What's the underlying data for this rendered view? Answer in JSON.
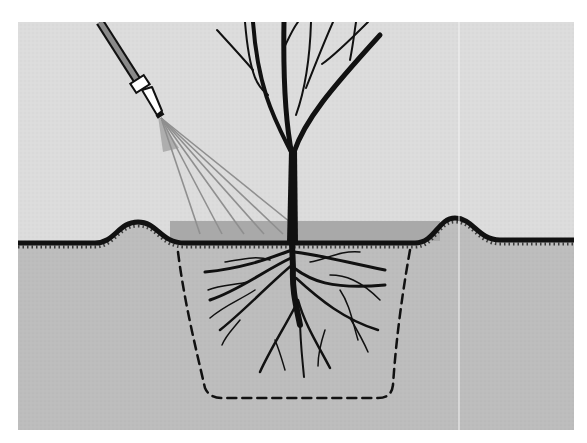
{
  "figure": {
    "frame": {
      "x": 18,
      "y": 22,
      "width": 556,
      "height": 408
    },
    "colors": {
      "page": "#ffffff",
      "sky": "#dcdcdc",
      "soil": "#bdbdbd",
      "water": "#a9a9a9",
      "ink": "#111111",
      "hose": "#8a8a8a",
      "spray": "#8f8f8f",
      "nozzle": "#ffffff",
      "crease": "#f2f2f2"
    },
    "ground": {
      "path": "M18,243 L95,243 C115,243 118,222 138,222 C158,222 160,243 185,243 L415,243 C435,243 438,218 455,218 C473,218 478,240 500,240 L574,240"
    },
    "water_basin": {
      "x": 170,
      "y": 221,
      "width": 270,
      "height": 20
    },
    "hose": {
      "tube": {
        "x1": 100,
        "y1": 22,
        "x2": 137,
        "y2": 80
      },
      "coupling": {
        "cx": 140,
        "cy": 84,
        "w": 16,
        "h": 11,
        "angle": 57
      },
      "nozzle": "M142,90 L152,87 L162,111 L157,115 Z",
      "tip": {
        "cx": 160,
        "cy": 115,
        "w": 8,
        "h": 4,
        "angle": 57
      }
    },
    "spray": {
      "origin": {
        "x": 161,
        "y": 118
      },
      "targets": [
        {
          "x": 200,
          "y": 234
        },
        {
          "x": 222,
          "y": 234
        },
        {
          "x": 244,
          "y": 234
        },
        {
          "x": 264,
          "y": 234
        },
        {
          "x": 283,
          "y": 234
        },
        {
          "x": 290,
          "y": 222
        }
      ]
    },
    "trunk": "M289,150 L297,150 L298,243 L287,243 Z",
    "branches": [
      {
        "d": "M292,155 C285,120 283,80 284,22",
        "w": 5
      },
      {
        "d": "M294,152 C305,120 330,90 380,35",
        "w": 5
      },
      {
        "d": "M290,150 C275,120 258,90 253,22",
        "w": 4
      },
      {
        "d": "M253,70 C240,55 228,42 217,30",
        "w": 2
      },
      {
        "d": "M268,95 C260,88 250,82 245,22",
        "w": 2
      },
      {
        "d": "M283,50 C288,40 292,30 298,22",
        "w": 2
      },
      {
        "d": "M296,115 C305,90 310,55 311,22",
        "w": 2
      },
      {
        "d": "M306,88 C315,65 325,40 333,22",
        "w": 2
      },
      {
        "d": "M322,64 C335,55 350,40 368,22",
        "w": 2
      },
      {
        "d": "M350,60 C353,45 354,35 356,22",
        "w": 2
      }
    ],
    "planting_hole": {
      "path": "M178,252 C184,300 195,345 205,388 C208,395 214,398 222,398 L378,398 C388,398 392,393 393,385 C396,340 402,295 410,250"
    },
    "roots": [
      {
        "d": "M292,243 L293,268 C292,290 296,305 300,325",
        "w": 6
      },
      {
        "d": "M292,250 C270,258 245,268 205,272",
        "w": 3
      },
      {
        "d": "M291,258 C265,270 240,290 210,300",
        "w": 3
      },
      {
        "d": "M292,265 C268,285 245,310 220,330",
        "w": 2.5
      },
      {
        "d": "M294,268 C310,280 330,290 385,285",
        "w": 3
      },
      {
        "d": "M294,252 C320,255 345,262 385,270",
        "w": 3
      },
      {
        "d": "M296,278 C320,300 345,320 378,330",
        "w": 2.5
      },
      {
        "d": "M298,300 C305,325 318,345 330,368",
        "w": 2.5
      },
      {
        "d": "M296,305 C283,330 270,350 260,372",
        "w": 2.5
      },
      {
        "d": "M300,318 C300,340 302,355 304,377",
        "w": 2
      },
      {
        "d": "M255,290 C240,300 225,305 210,318",
        "w": 1.5
      },
      {
        "d": "M248,282 C235,285 220,285 208,290",
        "w": 1.5
      },
      {
        "d": "M340,290 C350,305 352,320 358,340",
        "w": 1.5
      },
      {
        "d": "M350,318 C360,335 365,345 368,352",
        "w": 1.5
      },
      {
        "d": "M325,330 C320,345 318,358 318,366",
        "w": 1.5
      },
      {
        "d": "M275,340 C280,352 282,360 285,370",
        "w": 1.5
      },
      {
        "d": "M240,320 C232,330 226,335 222,345",
        "w": 1.5
      },
      {
        "d": "M330,275 C345,275 360,280 380,300",
        "w": 1.5
      },
      {
        "d": "M310,262 C325,260 340,250 360,252",
        "w": 1.5
      },
      {
        "d": "M270,260 C255,255 240,260 225,262",
        "w": 1.5
      }
    ],
    "crease_line": {
      "x": 459,
      "y1": 22,
      "y2": 430
    }
  }
}
